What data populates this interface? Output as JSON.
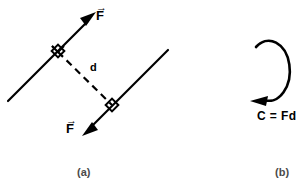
{
  "figure": {
    "width": 305,
    "height": 191,
    "background_color": "#ffffff",
    "ink_color": "#000000",
    "caption_color": "#4a4a4a"
  },
  "panel_a": {
    "caption": "(a)",
    "force_label_top": "F",
    "force_label_bottom": "F",
    "vector_overbar": "→",
    "distance_label": "d",
    "upper_force_line": {
      "from_x": 8,
      "from_y": 101,
      "to_x": 96,
      "to_y": 12,
      "arrow_at": "to",
      "style": "solid"
    },
    "lower_force_line": {
      "from_x": 168,
      "from_y": 50,
      "to_x": 82,
      "to_y": 136,
      "arrow_at": "to",
      "style": "solid"
    },
    "distance_line": {
      "from_x": 58,
      "from_y": 52,
      "to_x": 112,
      "to_y": 105,
      "style": "dashed"
    },
    "right_angle_marks": [
      {
        "x": 58,
        "y": 52
      },
      {
        "x": 112,
        "y": 105
      }
    ]
  },
  "panel_b": {
    "caption": "(b)",
    "couple_equation": "C = Fd",
    "rotation_arrow": {
      "center_x": 274,
      "center_y": 72,
      "radius_x": 21,
      "radius_y": 30,
      "direction": "counterclockwise",
      "gap_at": "upper-left",
      "arrowhead_at": "bottom-left"
    }
  }
}
